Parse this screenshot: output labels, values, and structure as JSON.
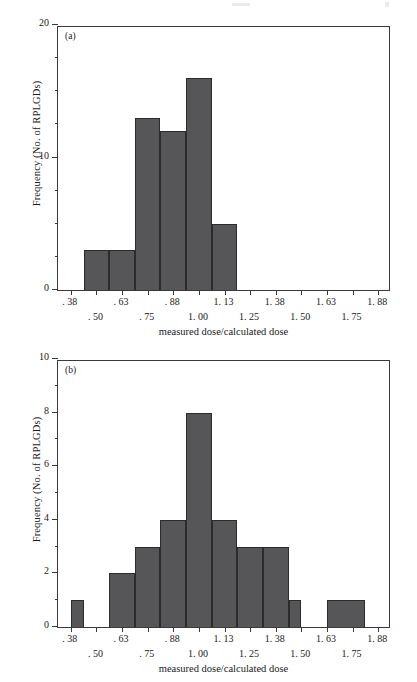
{
  "chart_data": [
    {
      "type": "bar",
      "panel": "(a)",
      "title": "",
      "xlabel": "measured dose/calculated dose",
      "ylabel": "Frequency (No. of RPLGDs)",
      "ylim": [
        0,
        20
      ],
      "yticks": [
        0,
        10,
        20
      ],
      "ytick_labels": [
        "0",
        "10",
        "20"
      ],
      "y_minor_step": 2.5,
      "xlim": [
        0.3125,
        1.9375
      ],
      "bin_width": 0.125,
      "xtick_values": [
        0.375,
        0.5,
        0.625,
        0.75,
        0.875,
        1.0,
        1.125,
        1.25,
        1.375,
        1.5,
        1.625,
        1.75,
        1.875
      ],
      "xtick_labels_top": [
        {
          "value": 0.375,
          "label": ". 38"
        },
        {
          "value": 0.625,
          "label": ". 63"
        },
        {
          "value": 0.875,
          "label": ". 88"
        },
        {
          "value": 1.125,
          "label": "1. 13"
        },
        {
          "value": 1.375,
          "label": "1. 38"
        },
        {
          "value": 1.625,
          "label": "1. 63"
        },
        {
          "value": 1.875,
          "label": "1. 88"
        }
      ],
      "xtick_labels_bottom": [
        {
          "value": 0.5,
          "label": ". 50"
        },
        {
          "value": 0.75,
          "label": ". 75"
        },
        {
          "value": 1.0,
          "label": "1. 00"
        },
        {
          "value": 1.25,
          "label": "1. 25"
        },
        {
          "value": 1.5,
          "label": "1. 50"
        },
        {
          "value": 1.75,
          "label": "1. 75"
        }
      ],
      "bins": [
        {
          "left": 0.4375,
          "right": 0.5625,
          "value": 3
        },
        {
          "left": 0.5625,
          "right": 0.6875,
          "value": 3
        },
        {
          "left": 0.6875,
          "right": 0.8125,
          "value": 13
        },
        {
          "left": 0.8125,
          "right": 0.9375,
          "value": 12
        },
        {
          "left": 0.9375,
          "right": 1.0625,
          "value": 16
        },
        {
          "left": 1.0625,
          "right": 1.1875,
          "value": 5
        }
      ],
      "grid": false,
      "legend": false
    },
    {
      "type": "bar",
      "panel": "(b)",
      "title": "",
      "xlabel": "measured dose/calculated dose",
      "ylabel": "Frequency (No. of RPLGDs)",
      "ylim": [
        0,
        10
      ],
      "yticks": [
        0,
        2,
        4,
        6,
        8,
        10
      ],
      "ytick_labels": [
        "0",
        "2",
        "4",
        "6",
        "8",
        "10"
      ],
      "y_minor_step": 1,
      "xlim": [
        0.3125,
        1.9375
      ],
      "bin_width": 0.125,
      "xtick_values": [
        0.375,
        0.5,
        0.625,
        0.75,
        0.875,
        1.0,
        1.125,
        1.25,
        1.375,
        1.5,
        1.625,
        1.75,
        1.875
      ],
      "xtick_labels_top": [
        {
          "value": 0.375,
          "label": ". 38"
        },
        {
          "value": 0.625,
          "label": ". 63"
        },
        {
          "value": 0.875,
          "label": ". 88"
        },
        {
          "value": 1.125,
          "label": "1. 13"
        },
        {
          "value": 1.375,
          "label": "1. 38"
        },
        {
          "value": 1.625,
          "label": "1. 63"
        },
        {
          "value": 1.875,
          "label": "1. 88"
        }
      ],
      "xtick_labels_bottom": [
        {
          "value": 0.5,
          "label": ". 50"
        },
        {
          "value": 0.75,
          "label": ". 75"
        },
        {
          "value": 1.0,
          "label": "1. 00"
        },
        {
          "value": 1.25,
          "label": "1. 25"
        },
        {
          "value": 1.5,
          "label": "1. 50"
        },
        {
          "value": 1.75,
          "label": "1. 75"
        }
      ],
      "bins": [
        {
          "left": 0.375,
          "right": 0.4375,
          "value": 1
        },
        {
          "left": 0.5625,
          "right": 0.6875,
          "value": 2
        },
        {
          "left": 0.6875,
          "right": 0.8125,
          "value": 3
        },
        {
          "left": 0.8125,
          "right": 0.9375,
          "value": 4
        },
        {
          "left": 0.9375,
          "right": 1.0625,
          "value": 8
        },
        {
          "left": 1.0625,
          "right": 1.1875,
          "value": 4
        },
        {
          "left": 1.1875,
          "right": 1.3125,
          "value": 3
        },
        {
          "left": 1.3125,
          "right": 1.4375,
          "value": 3
        },
        {
          "left": 1.4375,
          "right": 1.5,
          "value": 1
        },
        {
          "left": 1.625,
          "right": 1.8125,
          "value": 1
        }
      ],
      "grid": false,
      "legend": false
    }
  ],
  "figure_a": {
    "panel_tag": "(a)",
    "ylabel": "Frequency (No. of RPLGDs)",
    "xlabel": "measured dose/calculated dose"
  },
  "figure_b": {
    "panel_tag": "(b)",
    "ylabel": "Frequency (No. of RPLGDs)",
    "xlabel": "measured dose/calculated dose"
  },
  "colors": {
    "bar_fill": "#565659",
    "bar_edge": "#2b2b2e",
    "axis": "#3a3a3a",
    "text": "#1a1a1a",
    "background": "#ffffff"
  }
}
